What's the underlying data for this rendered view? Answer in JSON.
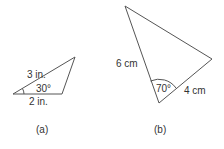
{
  "figure_a": {
    "caption": "(a)",
    "side_long": "3 in.",
    "side_base": "2 in.",
    "angle": "30°"
  },
  "figure_b": {
    "caption": "(b)",
    "side_left": "6 cm",
    "side_right": "4 cm",
    "angle": "70°"
  },
  "colors": {
    "line": "#555555",
    "text": "#333333"
  }
}
